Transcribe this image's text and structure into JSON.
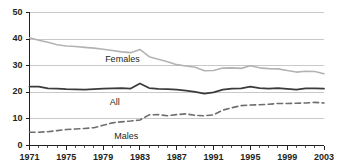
{
  "chart_data": {
    "type": "line",
    "title": "",
    "subtitle": "",
    "xlabel": "",
    "ylabel": "",
    "xlim": [
      1971,
      2003
    ],
    "ylim": [
      0,
      50
    ],
    "grid": true,
    "grid_axis": "y",
    "legend_position": "inline-annotations",
    "x": [
      1971,
      1972,
      1973,
      1974,
      1975,
      1976,
      1977,
      1978,
      1979,
      1980,
      1981,
      1982,
      1983,
      1984,
      1985,
      1986,
      1987,
      1988,
      1989,
      1990,
      1991,
      1992,
      1993,
      1994,
      1995,
      1996,
      1997,
      1998,
      1999,
      2000,
      2001,
      2002,
      2003
    ],
    "x_tick_labels": [
      "1971",
      "1975",
      "1979",
      "1983",
      "1987",
      "1991",
      "1995",
      "1999",
      "2003"
    ],
    "x_tick_values": [
      1971,
      1975,
      1979,
      1983,
      1987,
      1991,
      1995,
      1999,
      2003
    ],
    "y_tick_labels": [
      "0",
      "10",
      "20",
      "30",
      "40",
      "50"
    ],
    "y_tick_values": [
      0,
      10,
      20,
      30,
      40,
      50
    ],
    "minor_x_ticks_every": 1,
    "series": [
      {
        "name": "Females",
        "label": "Females",
        "color": "#b3b3b3",
        "style": "solid",
        "width": 1.6,
        "values": [
          40.5,
          39.6,
          38.8,
          37.9,
          37.4,
          37.2,
          36.9,
          36.6,
          36.2,
          35.7,
          35.2,
          34.9,
          36.1,
          33.4,
          32.4,
          31.5,
          30.4,
          29.9,
          29.4,
          28.1,
          28.2,
          29.1,
          29.2,
          29.0,
          30.0,
          29.2,
          28.9,
          28.8,
          28.2,
          27.6,
          27.9,
          27.8,
          27.0
        ]
      },
      {
        "name": "All",
        "label": "All",
        "color": "#3b3b3b",
        "style": "solid",
        "width": 1.8,
        "values": [
          22.1,
          22.1,
          21.5,
          21.4,
          21.2,
          21.1,
          21.0,
          21.2,
          21.4,
          21.5,
          21.6,
          21.4,
          23.3,
          21.6,
          21.3,
          21.2,
          21.0,
          20.6,
          20.2,
          19.5,
          20.0,
          21.0,
          21.4,
          21.5,
          22.1,
          21.6,
          21.4,
          21.6,
          21.3,
          21.0,
          21.5,
          21.5,
          21.4
        ]
      },
      {
        "name": "Males",
        "label": "Males",
        "color": "#6e6e6e",
        "style": "dashed",
        "width": 1.6,
        "values": [
          5.0,
          5.0,
          5.2,
          5.6,
          6.0,
          6.2,
          6.4,
          6.7,
          7.6,
          8.5,
          8.9,
          9.2,
          9.6,
          11.5,
          11.6,
          11.2,
          11.6,
          11.9,
          11.3,
          11.2,
          11.5,
          13.3,
          14.2,
          15.0,
          15.2,
          15.3,
          15.5,
          15.8,
          15.8,
          15.9,
          16.0,
          16.2,
          16.0
        ]
      }
    ],
    "annotations": [
      {
        "text": "Females",
        "x": 1979.0,
        "y": 32.2
      },
      {
        "text": "All",
        "x": 1979.5,
        "y": 16.0
      },
      {
        "text": "Males",
        "x": 1980.0,
        "y": 3.1
      }
    ]
  },
  "colors": {
    "axis": "#231f20",
    "gridline": "#c9c9c9",
    "text": "#231f20",
    "background": "#ffffff",
    "females": "#b3b3b3",
    "all": "#3b3b3b",
    "males": "#6e6e6e"
  }
}
